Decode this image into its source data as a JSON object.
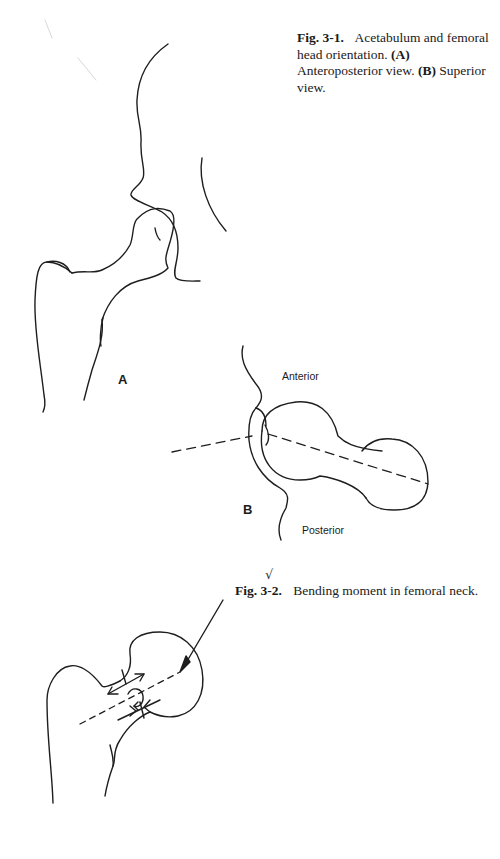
{
  "figures": [
    {
      "id": "fig-3-1",
      "number_label": "Fig. 3-1.",
      "caption_text": "Acetabulum and femoral head orientation.",
      "parts": [
        {
          "label": "(A)",
          "text": "Anteroposterior view."
        },
        {
          "label": "(B)",
          "text": "Superior view."
        }
      ],
      "panel_a": {
        "label": "A"
      },
      "panel_b": {
        "label": "B",
        "anterior_label": "Anterior",
        "posterior_label": "Posterior"
      }
    },
    {
      "id": "fig-3-2",
      "number_label": "Fig. 3-2.",
      "caption_text": "Bending moment in femoral neck.",
      "check_mark": "√"
    }
  ]
}
